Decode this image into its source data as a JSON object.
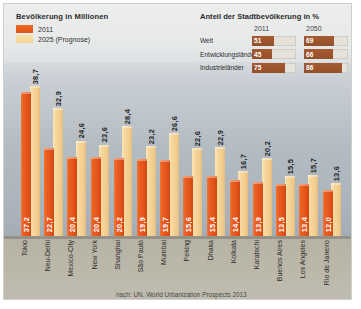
{
  "legend": {
    "title": "Bevölkerung in Millionen",
    "items": [
      {
        "label": "2011",
        "color": "#e2521a"
      },
      {
        "label": "2025 (Prognose)",
        "color": "#f3d294"
      }
    ]
  },
  "share_table": {
    "title": "Anteil der Stadtbevölkerung in %",
    "columns": [
      "2011",
      "2050"
    ],
    "rows": [
      {
        "name": "Welt",
        "v2011": 51,
        "v2050": 69
      },
      {
        "name": "Entwicklungsländer",
        "v2011": 45,
        "v2050": 66
      },
      {
        "name": "Industrieländer",
        "v2011": 75,
        "v2050": 86
      }
    ]
  },
  "source": "nach: UN, World Urbanization Prospects 2013",
  "chart_data": {
    "type": "bar",
    "title": "Bevölkerung in Millionen",
    "xlabel": "",
    "ylabel": "Millionen",
    "ylim": [
      0,
      38.7
    ],
    "grid": false,
    "legend_position": "top-left",
    "categories": [
      "Tokio",
      "Neu-Delhi",
      "Mexico-City",
      "New York",
      "Shanghai",
      "São Paulo",
      "Mumbai",
      "Peking",
      "Dhaka",
      "Kolkata",
      "Karatschi",
      "Buenos Aires",
      "Los Angeles",
      "Rio de Janeiro"
    ],
    "series": [
      {
        "name": "2011",
        "color": "#e2521a",
        "values": [
          37.2,
          22.7,
          20.4,
          20.4,
          20.2,
          19.9,
          19.7,
          15.6,
          15.4,
          14.4,
          13.9,
          13.5,
          13.4,
          12.0
        ]
      },
      {
        "name": "2025 (Prognose)",
        "color": "#f3d294",
        "values": [
          38.7,
          32.9,
          24.6,
          23.6,
          28.4,
          23.2,
          26.6,
          22.6,
          22.9,
          16.7,
          20.2,
          15.5,
          15.7,
          13.6
        ]
      }
    ],
    "value_labels": {
      "2011": [
        "37,2",
        "22,7",
        "20,4",
        "20,4",
        "20,2",
        "19,9",
        "19,7",
        "15,6",
        "15,4",
        "14,4",
        "13,9",
        "13,5",
        "13,4",
        "12,0"
      ],
      "2025": [
        "38,7",
        "32,9",
        "24,6",
        "23,6",
        "28,4",
        "23,2",
        "26,6",
        "22,6",
        "22,9",
        "16,7",
        "20,2",
        "15,5",
        "15,7",
        "13,6"
      ]
    }
  }
}
